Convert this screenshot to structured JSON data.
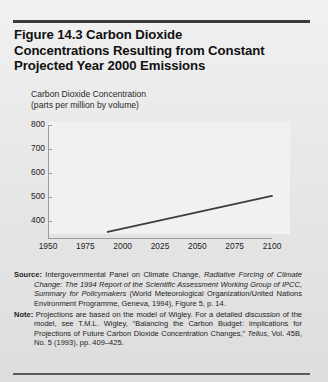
{
  "figure": {
    "title_lines": [
      "Figure 14.3  Carbon Dioxide",
      "Concentrations Resulting from Constant",
      "Projected Year 2000 Emissions"
    ],
    "axis_caption_lines": [
      "Carbon Dioxide Concentration",
      "(parts per million by volume)"
    ]
  },
  "source": {
    "label": "Source:",
    "text_1": " Intergovernmental Panel on Climate Change, ",
    "italic_1": "Radiative Forcing of Climate Change: The 1994 Report of the Scientific Assessment Working Group of IPCC, Summary for Policymakers",
    "text_2": " (World Meteorological Organization/United Nations Environment Programme, Geneva, 1994), Figure 5, p. 14."
  },
  "note": {
    "label": "Note:",
    "text_1": " Projections are based on the model of Wigley. For a detailed discussion of the model, see T.M.L. Wigley, “Balancing the Carbon Budget: Implications for Projections of Future Carbon Dioxide Concentration Changes,” ",
    "italic_1": "Tellus",
    "text_2": ", Vol. 45B, No. 5 (1993), pp. 409–425."
  },
  "chart_data": {
    "type": "line",
    "title": "Figure 14.3  Carbon Dioxide Concentrations Resulting from Constant Projected Year 2000 Emissions",
    "xlabel": "",
    "ylabel": "Carbon Dioxide Concentration (parts per million by volume)",
    "xlim": [
      1950,
      2100
    ],
    "ylim": [
      330,
      800
    ],
    "xticks": [
      1950,
      1975,
      2000,
      2025,
      2050,
      2075,
      2100
    ],
    "yticks": [
      400,
      500,
      600,
      700,
      800
    ],
    "grid": false,
    "legend": null,
    "series": [
      {
        "name": "Constant year 2000 emissions projection",
        "color": "#3d3d3d",
        "x": [
          1990,
          2100
        ],
        "values": [
          355,
          505
        ]
      }
    ]
  }
}
